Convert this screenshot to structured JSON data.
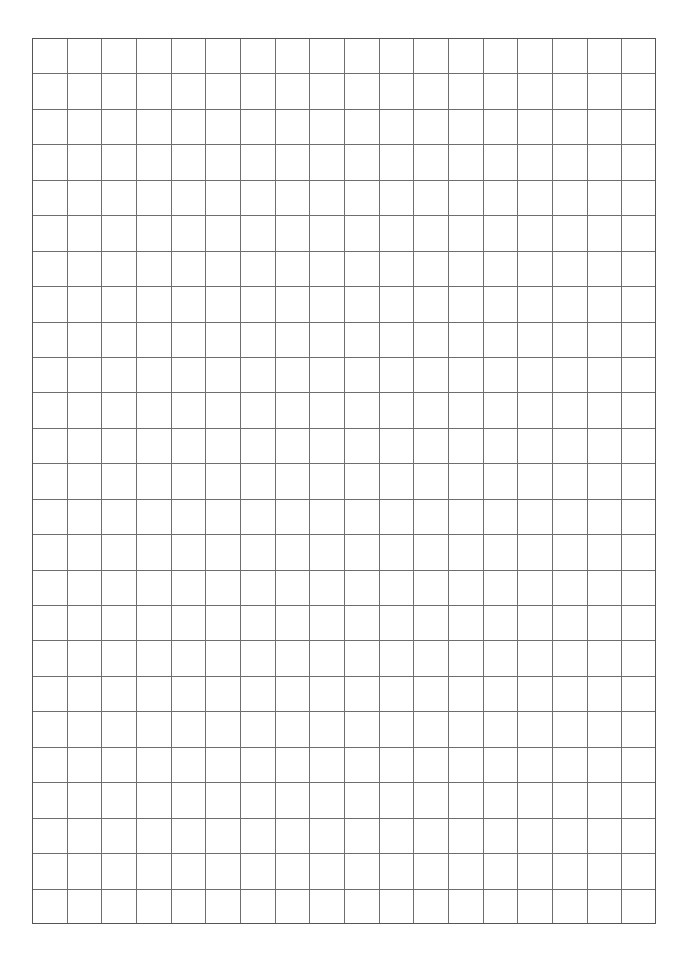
{
  "page": {
    "width": 693,
    "height": 959,
    "background_color": "#ffffff"
  },
  "grid": {
    "label": "graph-paper-grid",
    "columns": 18,
    "rows": 25,
    "origin_x": 32,
    "origin_y": 38,
    "width": 624,
    "height": 886,
    "cell_width": 34.67,
    "cell_height": 35.44,
    "line_color": "#6e6e6e",
    "line_width": 1,
    "border_color": "#555555",
    "border_width": 1.2,
    "cell_background": "#ffffff",
    "content": ""
  },
  "chart_data": {
    "type": "table",
    "title": "",
    "xlabel": "",
    "ylabel": "",
    "categories": [],
    "values": [],
    "grid": true,
    "legend": "none",
    "note": "Empty grid/squared paper: 18 columns by 25 rows, no data plotted"
  }
}
